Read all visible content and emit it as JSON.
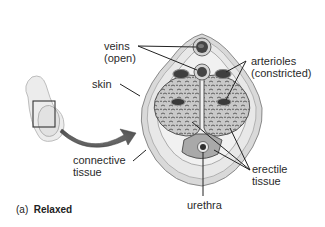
{
  "diagram": {
    "labels": {
      "veins": [
        "veins",
        "(open)"
      ],
      "arterioles": [
        "arterioles",
        "(constricted)"
      ],
      "skin": "skin",
      "connective_tissue": [
        "connective",
        "tissue"
      ],
      "erectile_tissue": [
        "erectile",
        "tissue"
      ],
      "urethra": "urethra"
    },
    "caption": {
      "letter": "(a)",
      "text": "Relaxed"
    },
    "colors": {
      "outline": "#333333",
      "skin_fill": "#d6d6d6",
      "connective_fill": "#e4e4e4",
      "erectile_fill": "#bdbdbd",
      "vessel_dark": "#3a3a3a",
      "arrow": "#5a5a5a",
      "leader_line": "#222222"
    }
  }
}
